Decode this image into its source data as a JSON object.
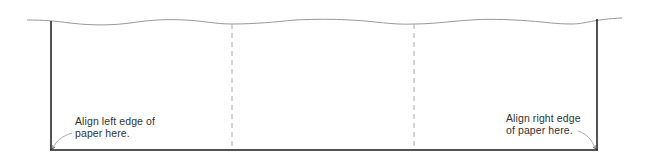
{
  "diagram": {
    "type": "paper-alignment-guide",
    "colors": {
      "background": "#ffffff",
      "frame": "#1a1a1a",
      "wavy_edge": "#999999",
      "dashed_fold": "#aaaaaa",
      "pointer": "#aaaaaa",
      "text": "#333333"
    },
    "panels": 3,
    "labels": {
      "left": "Align left edge of\npaper here.",
      "right": "Align right edge\nof paper here."
    }
  }
}
